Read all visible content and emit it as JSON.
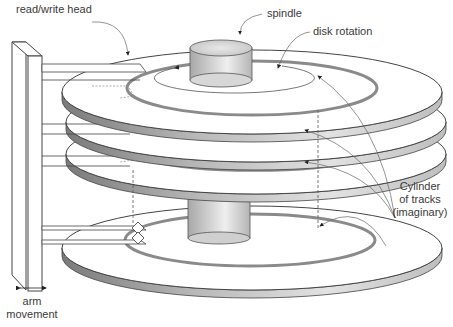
{
  "labels": {
    "read_write_head": "read/write head",
    "spindle": "spindle",
    "disk_rotation": "disk rotation",
    "cylinder_line1": "Cylinder",
    "cylinder_line2": "of tracks",
    "cylinder_line3": "(imaginary)",
    "arm_line1": "arm",
    "arm_line2": "movement"
  },
  "components": {
    "platters": 4,
    "arms": 4,
    "spindle": "spindle-cylinder",
    "track_color": "#8a8a8a",
    "platter_edge_color": "#9c9c9c",
    "line_color": "#4a4a4a"
  }
}
